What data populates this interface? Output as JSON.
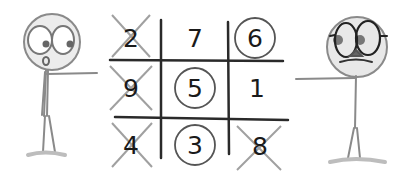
{
  "scene": {
    "description": "Two stick figures pointing at a 3x3 number grid game",
    "colors": {
      "ink": "#1f1f1f",
      "pencil": "#8a8a8a",
      "cross": "#9a9a9a",
      "face_fill": "#e6e6e6",
      "ground": "#bdbdbd"
    }
  },
  "grid": {
    "cells": [
      {
        "row": 0,
        "col": 0,
        "value": "2",
        "mark": "cross"
      },
      {
        "row": 0,
        "col": 1,
        "value": "7",
        "mark": "none"
      },
      {
        "row": 0,
        "col": 2,
        "value": "6",
        "mark": "circle"
      },
      {
        "row": 1,
        "col": 0,
        "value": "9",
        "mark": "cross"
      },
      {
        "row": 1,
        "col": 1,
        "value": "5",
        "mark": "circle"
      },
      {
        "row": 1,
        "col": 2,
        "value": "1",
        "mark": "none"
      },
      {
        "row": 2,
        "col": 0,
        "value": "4",
        "mark": "cross"
      },
      {
        "row": 2,
        "col": 1,
        "value": "3",
        "mark": "circle"
      },
      {
        "row": 2,
        "col": 2,
        "value": "8",
        "mark": "cross"
      }
    ]
  },
  "players": {
    "left": {
      "label": "surprised stick figure",
      "pointing": "right"
    },
    "right": {
      "label": "stick figure with glasses and mustache",
      "pointing": "left"
    }
  }
}
